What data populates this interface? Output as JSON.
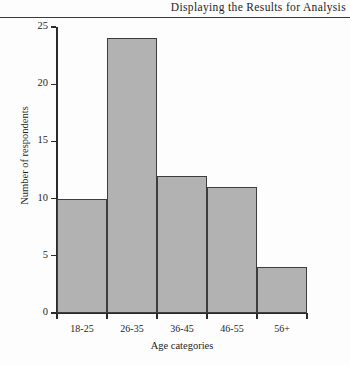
{
  "header": {
    "title": "Displaying the Results for Analysis"
  },
  "chart_data": {
    "type": "bar",
    "title": "",
    "categories": [
      "18-25",
      "26-35",
      "36-45",
      "46-55",
      "56+"
    ],
    "values": [
      10,
      24,
      12,
      11,
      4
    ],
    "xlabel": "Age categories",
    "ylabel": "Number of respondents",
    "ylim": [
      0,
      25
    ],
    "yticks": [
      0,
      5,
      10,
      15,
      20,
      25
    ],
    "ytick_labels": [
      "0",
      "5",
      "10",
      "15",
      "20",
      "25"
    ],
    "grid": false,
    "legend": null,
    "bar_fill_color": "#b2b2b2",
    "bar_border_color": "#3d3d3d",
    "axis_color": "#2b2b2b",
    "background_color": "#fdfdfd"
  }
}
